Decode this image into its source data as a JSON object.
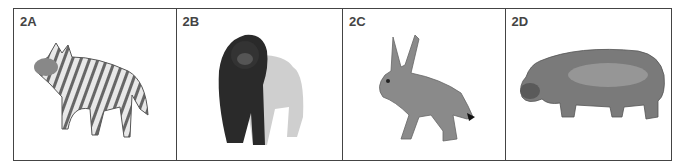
{
  "panels": [
    {
      "label": "2A",
      "animal": "striped hyena"
    },
    {
      "label": "2B",
      "animal": "gorilla"
    },
    {
      "label": "2C",
      "animal": "hare"
    },
    {
      "label": "2D",
      "animal": "hippopotamus"
    }
  ]
}
